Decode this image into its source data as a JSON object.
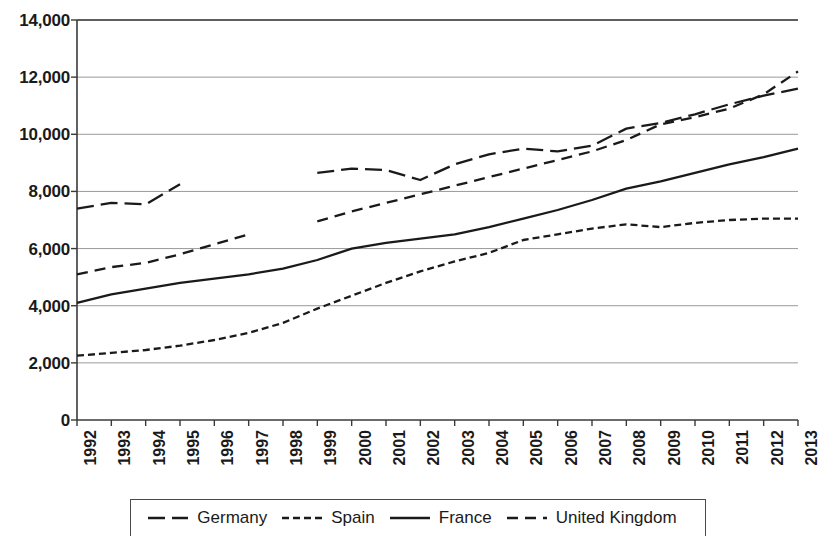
{
  "chart_data": {
    "type": "line",
    "title": "",
    "subtitle": "",
    "xlabel": "",
    "ylabel": "",
    "xlim": [
      1992,
      2013
    ],
    "ylim": [
      0,
      14000
    ],
    "grid": true,
    "grid_axis": "y",
    "legend_position": "bottom",
    "y_ticks": [
      0,
      2000,
      4000,
      6000,
      8000,
      10000,
      12000,
      14000
    ],
    "y_tick_labels": [
      "0",
      "2,000",
      "4,000",
      "6,000",
      "8,000",
      "10,000",
      "12,000",
      "14,000"
    ],
    "x": [
      1992,
      1993,
      1994,
      1995,
      1996,
      1997,
      1998,
      1999,
      2000,
      2001,
      2002,
      2003,
      2004,
      2005,
      2006,
      2007,
      2008,
      2009,
      2010,
      2011,
      2012,
      2013
    ],
    "x_tick_labels": [
      "1992",
      "1993",
      "1994",
      "1995",
      "1996",
      "1997",
      "1998",
      "1999",
      "2000",
      "2001",
      "2002",
      "2003",
      "2004",
      "2005",
      "2006",
      "2007",
      "2008",
      "2009",
      "2010",
      "2011",
      "2012",
      "2013"
    ],
    "series": [
      {
        "name": "Germany",
        "style": "long-dash",
        "color": "#1a1a1a",
        "values": [
          7400,
          7600,
          7550,
          8250,
          null,
          null,
          null,
          8650,
          8800,
          8750,
          8400,
          8950,
          9300,
          9500,
          9400,
          9600,
          10200,
          10400,
          10700,
          11050,
          11350,
          11600
        ]
      },
      {
        "name": "Spain",
        "style": "short-dash",
        "color": "#1a1a1a",
        "values": [
          2250,
          2350,
          2450,
          2600,
          2800,
          3050,
          3400,
          3900,
          4350,
          4800,
          5200,
          5550,
          5850,
          6300,
          6500,
          6700,
          6850,
          6750,
          6900,
          7000,
          7050,
          7050
        ]
      },
      {
        "name": "France",
        "style": "solid",
        "color": "#1a1a1a",
        "values": [
          4100,
          4400,
          4600,
          4800,
          4950,
          5100,
          5300,
          5600,
          6000,
          6200,
          6350,
          6500,
          6750,
          7050,
          7350,
          7700,
          8100,
          8350,
          8650,
          8950,
          9200,
          9500
        ]
      },
      {
        "name": "United Kingdom",
        "style": "medium-dash",
        "color": "#1a1a1a",
        "values": [
          5100,
          5350,
          5500,
          5800,
          6150,
          6500,
          null,
          6950,
          7300,
          7600,
          7900,
          8200,
          8500,
          8800,
          9100,
          9400,
          9800,
          10350,
          10600,
          10900,
          11400,
          12200
        ]
      }
    ]
  },
  "legend": {
    "items": [
      {
        "label": "Germany",
        "swatch": "long-dash-swatch"
      },
      {
        "label": "Spain",
        "swatch": "short-dash-swatch"
      },
      {
        "label": "France",
        "swatch": "solid-line-swatch"
      },
      {
        "label": "United Kingdom",
        "swatch": "medium-dash-swatch"
      }
    ]
  },
  "axes": {
    "y_label_0": "0",
    "y_label_1": "2,000",
    "y_label_2": "4,000",
    "y_label_3": "6,000",
    "y_label_4": "8,000",
    "y_label_5": "10,000",
    "y_label_6": "12,000",
    "y_label_7": "14,000"
  },
  "colors": {
    "ink": "#1a1a1a",
    "gridline": "#9a9a9a",
    "axis": "#3a3a3a",
    "background": "#ffffff"
  }
}
